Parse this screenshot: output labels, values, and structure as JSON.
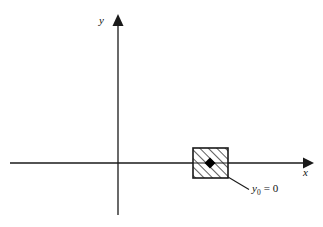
{
  "figure": {
    "background_color": "#ffffff",
    "stroke_color": "#1a1a1a",
    "marker_color": "#000000",
    "axes": {
      "x_label": "x",
      "y_label": "y",
      "origin": {
        "x": 118,
        "y": 163
      },
      "x_axis": {
        "x_start": 10,
        "x_end": 310,
        "y": 163,
        "arrow": "right"
      },
      "y_axis": {
        "x": 118,
        "y_start": 215,
        "y_end": 18,
        "arrow": "up"
      }
    },
    "region": {
      "name": "hatched-support-region",
      "hatch_direction": "forward-diagonal",
      "x": 193,
      "y": 148,
      "width": 35,
      "height": 30,
      "center_marker": "diamond"
    },
    "callout": {
      "text": "y0 = 0",
      "variable": "y",
      "subscript": "0",
      "relation": "=",
      "value": "0",
      "leader_from": {
        "x": 228,
        "y": 177
      },
      "leader_to": {
        "x": 248,
        "y": 189
      }
    }
  }
}
